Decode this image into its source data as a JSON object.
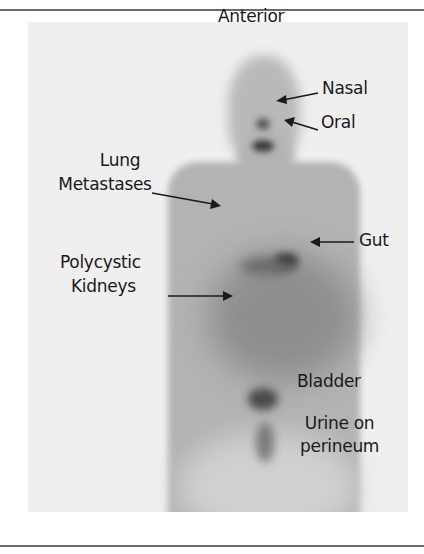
{
  "figure": {
    "view_label": "Anterior",
    "annotations": [
      {
        "id": "nasal",
        "text": "Nasal"
      },
      {
        "id": "oral",
        "text": "Oral"
      },
      {
        "id": "lung",
        "lines": [
          "Lung",
          "Metastases"
        ]
      },
      {
        "id": "gut",
        "text": "Gut"
      },
      {
        "id": "kidneys",
        "lines": [
          "Polycystic",
          "Kidneys"
        ]
      },
      {
        "id": "bladder",
        "text": "Bladder"
      },
      {
        "id": "urine",
        "lines": [
          "Urine on",
          "perineum"
        ]
      }
    ],
    "colors": {
      "background": "#efefef",
      "body": "#a9a9a9",
      "hotspot": "#2e2e2e",
      "text": "#1a1a1a",
      "rule": "#6a6a6a"
    }
  }
}
